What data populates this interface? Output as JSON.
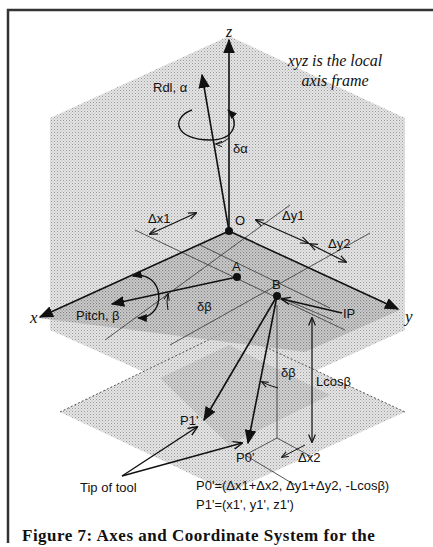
{
  "figure": {
    "note_line1": "xyz is the local",
    "note_line2": "axis frame",
    "axes": {
      "x": "x",
      "y": "y",
      "z": "z"
    },
    "points": {
      "origin": "O",
      "a": "A",
      "b": "B",
      "ip": "IP",
      "p0": "P0'",
      "p1": "P1'"
    },
    "angles": {
      "roll": "Rdl, α",
      "delta_alpha": "δα",
      "pitch": "Pitch, β",
      "delta_beta_1": "δβ",
      "delta_beta_2": "δβ",
      "length": "Lcosβ"
    },
    "offsets": {
      "dx1": "Δx1",
      "dy1": "Δy1",
      "dy2": "Δy2",
      "dx2": "Δx2"
    },
    "tip_label": "Tip of tool",
    "equation_p0": "P0'=(Δx1+Δx2, Δy1+Δy2, -Lcosβ)",
    "equation_p1": "P1'=(x1', y1', z1')",
    "caption": "Figure 7: Axes and Coordinate System for the"
  },
  "colors": {
    "line": "#111111",
    "shade_light": "#d9d9d9",
    "shade_mid": "#bdbdbd",
    "shade_dark": "#a8a8a8",
    "frame": "#333333"
  }
}
